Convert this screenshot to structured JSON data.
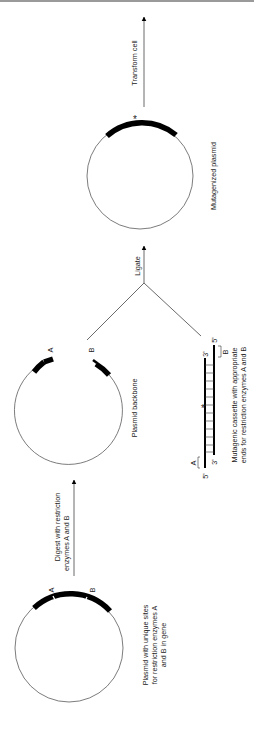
{
  "diagram": {
    "orientation": "rotated-90-ccw",
    "steps": [
      {
        "id": "plasmid-original",
        "caption_lines": [
          "Plasmid with unique sites",
          "for restriction enzymes A",
          "and B in gene"
        ],
        "site_labels": [
          "A",
          "B"
        ]
      },
      {
        "id": "digest",
        "arrow_label_lines": [
          "Digest with restriction",
          "enzymes A and B"
        ]
      },
      {
        "id": "plasmid-backbone",
        "caption": "Plasmid backbone",
        "end_labels": [
          "A",
          "B"
        ]
      },
      {
        "id": "mutagenic-cassette",
        "caption_lines": [
          "Mutagenic cassette with appropriate",
          "ends for restriction enzymes A and B"
        ],
        "end_labels": [
          "A",
          "B"
        ],
        "strand_labels": {
          "top_left": "5'",
          "bottom_left": "3'",
          "top_right": "3'",
          "bottom_right": "5'"
        },
        "mutation_marker": "*"
      },
      {
        "id": "ligate",
        "arrow_label": "Ligate"
      },
      {
        "id": "mutagenized-plasmid",
        "caption": "Mutagenized plasmid",
        "mutation_marker": "*"
      },
      {
        "id": "transform",
        "arrow_label": "Transform cell"
      }
    ]
  }
}
